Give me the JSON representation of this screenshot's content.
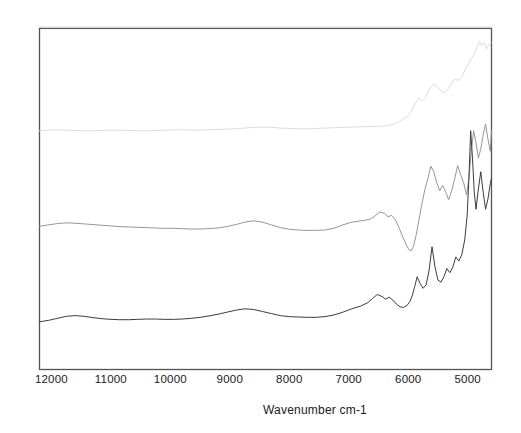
{
  "figure": {
    "background_color": "#ffffff",
    "frame_color": "#545454"
  },
  "axis": {
    "x_title": "Wavenumber cm-1",
    "tick_labels": [
      "12000",
      "11000",
      "10000",
      "9000",
      "8000",
      "7000",
      "6000",
      "5000"
    ]
  },
  "chart_data": {
    "type": "line",
    "title": "",
    "xlabel": "Wavenumber cm-1",
    "ylabel": "",
    "xlim": [
      12200,
      4600
    ],
    "ylim": [
      0,
      1
    ],
    "x_inverted": true,
    "grid": false,
    "legend": "none",
    "xticks": [
      12000,
      11000,
      10000,
      9000,
      8000,
      7000,
      6000,
      5000
    ],
    "xticklabels": [
      "12000",
      "11000",
      "10000",
      "9000",
      "8000",
      "7000",
      "6000",
      "5000"
    ],
    "yticks": [],
    "yticklabels": [],
    "series": [
      {
        "name": "top-spectrum",
        "color": "#d8d8d8",
        "linewidth": 0.9,
        "x": [
          12200,
          12050,
          11900,
          11750,
          11600,
          11450,
          11300,
          11150,
          11000,
          10850,
          10700,
          10550,
          10400,
          10250,
          10100,
          9950,
          9800,
          9650,
          9500,
          9350,
          9200,
          9050,
          8900,
          8750,
          8600,
          8450,
          8300,
          8150,
          8000,
          7850,
          7700,
          7550,
          7400,
          7250,
          7100,
          6950,
          6800,
          6650,
          6500,
          6400,
          6320,
          6240,
          6160,
          6080,
          6000,
          5940,
          5880,
          5820,
          5760,
          5700,
          5640,
          5580,
          5520,
          5460,
          5400,
          5340,
          5280,
          5220,
          5160,
          5100,
          5040,
          4980,
          4920,
          4880,
          4840,
          4800,
          4760,
          4720,
          4680,
          4640,
          4600
        ],
        "y": [
          0.7,
          0.702,
          0.703,
          0.702,
          0.701,
          0.7,
          0.7,
          0.701,
          0.702,
          0.702,
          0.701,
          0.7,
          0.7,
          0.701,
          0.702,
          0.703,
          0.703,
          0.702,
          0.702,
          0.703,
          0.704,
          0.705,
          0.706,
          0.708,
          0.71,
          0.711,
          0.71,
          0.708,
          0.707,
          0.706,
          0.706,
          0.707,
          0.708,
          0.709,
          0.71,
          0.711,
          0.712,
          0.712,
          0.713,
          0.714,
          0.716,
          0.72,
          0.726,
          0.734,
          0.744,
          0.76,
          0.782,
          0.796,
          0.788,
          0.8,
          0.824,
          0.838,
          0.83,
          0.818,
          0.812,
          0.82,
          0.838,
          0.852,
          0.848,
          0.858,
          0.88,
          0.9,
          0.916,
          0.93,
          0.948,
          0.962,
          0.95,
          0.958,
          0.94,
          0.952,
          0.96
        ]
      },
      {
        "name": "middle-spectrum",
        "color": "#8a8a8a",
        "linewidth": 0.9,
        "x": [
          12200,
          12050,
          11900,
          11750,
          11600,
          11450,
          11300,
          11150,
          11000,
          10850,
          10700,
          10550,
          10400,
          10250,
          10100,
          9950,
          9800,
          9650,
          9500,
          9350,
          9200,
          9050,
          8900,
          8750,
          8600,
          8450,
          8300,
          8150,
          8000,
          7850,
          7700,
          7550,
          7400,
          7250,
          7100,
          6950,
          6800,
          6650,
          6560,
          6480,
          6400,
          6340,
          6280,
          6220,
          6160,
          6100,
          6040,
          5990,
          5950,
          5910,
          5870,
          5820,
          5770,
          5720,
          5670,
          5620,
          5570,
          5520,
          5470,
          5420,
          5370,
          5320,
          5270,
          5220,
          5170,
          5120,
          5070,
          5020,
          4980,
          4940,
          4900,
          4860,
          4820,
          4780,
          4740,
          4700,
          4660,
          4620,
          4600
        ],
        "y": [
          0.42,
          0.424,
          0.428,
          0.43,
          0.429,
          0.427,
          0.425,
          0.423,
          0.421,
          0.419,
          0.418,
          0.417,
          0.416,
          0.415,
          0.414,
          0.414,
          0.413,
          0.412,
          0.412,
          0.413,
          0.415,
          0.419,
          0.425,
          0.432,
          0.436,
          0.432,
          0.424,
          0.416,
          0.411,
          0.409,
          0.408,
          0.408,
          0.409,
          0.414,
          0.424,
          0.432,
          0.436,
          0.44,
          0.45,
          0.462,
          0.458,
          0.448,
          0.452,
          0.44,
          0.418,
          0.392,
          0.368,
          0.352,
          0.348,
          0.362,
          0.392,
          0.438,
          0.486,
          0.528,
          0.56,
          0.596,
          0.58,
          0.548,
          0.524,
          0.54,
          0.52,
          0.498,
          0.524,
          0.558,
          0.598,
          0.572,
          0.548,
          0.512,
          0.56,
          0.64,
          0.7,
          0.664,
          0.62,
          0.648,
          0.688,
          0.72,
          0.676,
          0.64,
          0.7
        ]
      },
      {
        "name": "bottom-spectrum",
        "color": "#3c3c3c",
        "linewidth": 1.0,
        "x": [
          12200,
          12050,
          11900,
          11750,
          11600,
          11450,
          11300,
          11150,
          11000,
          10850,
          10700,
          10550,
          10400,
          10250,
          10100,
          9950,
          9800,
          9650,
          9500,
          9350,
          9200,
          9050,
          8900,
          8750,
          8600,
          8450,
          8300,
          8150,
          8000,
          7850,
          7700,
          7550,
          7400,
          7250,
          7100,
          6950,
          6800,
          6680,
          6600,
          6520,
          6440,
          6380,
          6320,
          6260,
          6200,
          6140,
          6080,
          6020,
          5970,
          5930,
          5890,
          5850,
          5800,
          5750,
          5700,
          5650,
          5600,
          5550,
          5500,
          5450,
          5400,
          5350,
          5300,
          5250,
          5200,
          5150,
          5100,
          5050,
          5010,
          4980,
          4950,
          4920,
          4890,
          4860,
          4820,
          4780,
          4740,
          4700,
          4660,
          4620,
          4600
        ],
        "y": [
          0.14,
          0.144,
          0.15,
          0.156,
          0.158,
          0.156,
          0.152,
          0.149,
          0.147,
          0.146,
          0.146,
          0.147,
          0.148,
          0.148,
          0.147,
          0.147,
          0.148,
          0.15,
          0.153,
          0.157,
          0.162,
          0.168,
          0.174,
          0.178,
          0.176,
          0.17,
          0.164,
          0.158,
          0.155,
          0.154,
          0.153,
          0.153,
          0.155,
          0.16,
          0.168,
          0.178,
          0.186,
          0.196,
          0.208,
          0.22,
          0.214,
          0.206,
          0.212,
          0.204,
          0.192,
          0.184,
          0.182,
          0.188,
          0.2,
          0.218,
          0.244,
          0.272,
          0.252,
          0.238,
          0.248,
          0.29,
          0.36,
          0.3,
          0.262,
          0.256,
          0.272,
          0.296,
          0.284,
          0.3,
          0.33,
          0.318,
          0.336,
          0.38,
          0.45,
          0.56,
          0.7,
          0.62,
          0.52,
          0.47,
          0.53,
          0.58,
          0.52,
          0.47,
          0.5,
          0.545,
          0.56
        ]
      }
    ]
  }
}
